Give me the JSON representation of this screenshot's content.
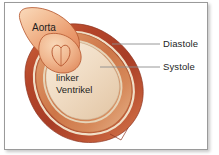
{
  "figure": {
    "language": "de"
  },
  "labels": {
    "aorta": "Aorta",
    "ventricle_line1": "linker",
    "ventricle_line2": "Ventrikel",
    "diastole": "Diastole",
    "systole": "Systole"
  },
  "colors": {
    "background": "#ffffff",
    "frame_border": "#9a9a9a",
    "text": "#231f1e",
    "leader_line": "#8d8d8d",
    "aorta_light": "#f6c9a6",
    "aorta_mid": "#e8936a",
    "aorta_outline": "#b4542c",
    "diastole_dark": "#b1432a",
    "diastole_mid": "#c2522f",
    "systole_mid": "#cf7f4f",
    "systole_light": "#e3a178",
    "cavity_light": "#f0dcc4",
    "cavity_outline": "#cbb89c"
  },
  "annotations": {
    "diastole_leader_from_x": 112,
    "diastole_leader_to_x": 160,
    "systole_leader_from_x": 100,
    "systole_leader_to_x": 160
  }
}
